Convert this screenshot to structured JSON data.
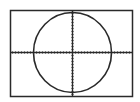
{
  "screen": {
    "background": "#ffffff",
    "ink": "#2a2a2a",
    "frame": {
      "x": 10.5,
      "y": 10.5,
      "w": 122,
      "h": 86
    }
  },
  "chart_data": {
    "type": "line",
    "title": "",
    "xlabel": "",
    "ylabel": "",
    "equation": "x^2 + y^2 = r^2",
    "axes": {
      "origin_px": [
        72,
        52
      ],
      "x_tick_spacing_px": 3,
      "y_tick_spacing_px": 3,
      "x_range_px": [
        11,
        132
      ],
      "y_range_px": [
        11,
        96
      ]
    },
    "circle": {
      "cx_px": 72,
      "cy_px": 52,
      "rx_px": 39,
      "ry_px": 40
    },
    "grid": false,
    "legend": null
  }
}
